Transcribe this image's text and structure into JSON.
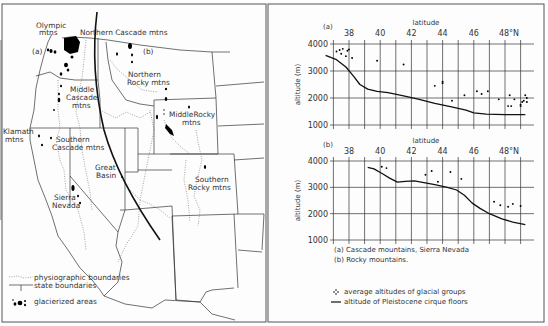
{
  "map": {
    "labels": {
      "olympic": [
        "Olympic",
        "mtns"
      ],
      "northern_cascade": "Northern Cascade mtns",
      "a_marker": "(a)",
      "b_marker": "(b)",
      "northern_rocky": [
        "Northern",
        "Rocky mtns"
      ],
      "middle_cascade": [
        "Middle",
        "Cascade",
        "mtns"
      ],
      "middle_rocky": [
        "MiddleRocky",
        "mtns"
      ],
      "klamath": [
        "Klamath",
        "mtns"
      ],
      "southern_cascade": [
        "Southern",
        "Cascade mtns"
      ],
      "great_basin": [
        "Great",
        "Basin"
      ],
      "sierra_nevada": [
        "Sierra",
        "Nevada"
      ],
      "southern_rocky": [
        "Southern",
        "Rocky mtns"
      ]
    },
    "legend": {
      "physiographic": "physiographic boundaries",
      "state": "state boundaries",
      "glacierized": "glacierized areas"
    }
  },
  "chart_data": [
    {
      "id": "a",
      "type": "scatter+line",
      "panel_label": "(a)",
      "title": "Cascade mountains, Sierra Nevada",
      "xlabel": "latitude",
      "ylabel": "altitude (m)",
      "x_ticks": [
        "38",
        "40",
        "42",
        "44",
        "46",
        "48°N"
      ],
      "x_tick_values": [
        38,
        40,
        42,
        44,
        46,
        48
      ],
      "y_ticks": [
        "4000",
        "3000",
        "2000",
        "1000"
      ],
      "y_tick_values": [
        4000,
        3000,
        2000,
        1000
      ],
      "xlim": [
        37,
        49.5
      ],
      "ylim": [
        1000,
        4000
      ],
      "grid": true,
      "series": [
        {
          "name": "average altitudes of glacial groups",
          "kind": "points",
          "points": [
            [
              37.2,
              3720
            ],
            [
              37.4,
              3780
            ],
            [
              37.6,
              3820
            ],
            [
              37.5,
              3640
            ],
            [
              37.9,
              3750
            ],
            [
              38.0,
              3800
            ],
            [
              37.8,
              3550
            ],
            [
              38.2,
              3480
            ],
            [
              39.8,
              3380
            ],
            [
              41.5,
              3240
            ],
            [
              43.5,
              2450
            ],
            [
              44.0,
              2600
            ],
            [
              44.0,
              2550
            ],
            [
              44.6,
              1900
            ],
            [
              45.4,
              2100
            ],
            [
              46.2,
              2250
            ],
            [
              46.5,
              2150
            ],
            [
              46.9,
              2250
            ],
            [
              47.6,
              1950
            ],
            [
              48.2,
              1700
            ],
            [
              48.3,
              2100
            ],
            [
              48.4,
              1700
            ],
            [
              48.6,
              1950
            ],
            [
              49.0,
              1750
            ],
            [
              49.1,
              1850
            ],
            [
              49.2,
              1900
            ],
            [
              49.3,
              2100
            ],
            [
              49.4,
              2000
            ],
            [
              49.4,
              1850
            ],
            [
              49.0,
              1700
            ]
          ]
        },
        {
          "name": "altitude of Pleistocene cirque floors",
          "kind": "line",
          "points": [
            [
              36.5,
              3580
            ],
            [
              37.2,
              3420
            ],
            [
              37.8,
              3150
            ],
            [
              38.3,
              2800
            ],
            [
              38.7,
              2500
            ],
            [
              39.2,
              2330
            ],
            [
              39.8,
              2250
            ],
            [
              40.5,
              2200
            ],
            [
              41.5,
              2080
            ],
            [
              42.5,
              1950
            ],
            [
              43.5,
              1800
            ],
            [
              44.5,
              1680
            ],
            [
              45.5,
              1550
            ],
            [
              46.0,
              1450
            ],
            [
              46.8,
              1400
            ],
            [
              48.0,
              1380
            ],
            [
              49.3,
              1380
            ]
          ]
        }
      ]
    },
    {
      "id": "b",
      "type": "scatter+line",
      "panel_label": "(b)",
      "title": "Rocky mountains.",
      "xlabel": "latitude",
      "ylabel": "altitude (m)",
      "x_ticks": [
        "38",
        "40",
        "42",
        "44",
        "46",
        "48°N"
      ],
      "x_tick_values": [
        38,
        40,
        42,
        44,
        46,
        48
      ],
      "y_ticks": [
        "4000",
        "3000",
        "2000",
        "1000"
      ],
      "y_tick_values": [
        4000,
        3000,
        2000,
        1000
      ],
      "xlim": [
        37,
        49.5
      ],
      "ylim": [
        1000,
        4000
      ],
      "grid": true,
      "series": [
        {
          "name": "average altitudes of glacial groups",
          "kind": "points",
          "points": [
            [
              40.1,
              3780
            ],
            [
              40.4,
              3730
            ],
            [
              42.9,
              3480
            ],
            [
              43.3,
              3620
            ],
            [
              43.7,
              3210
            ],
            [
              44.5,
              3580
            ],
            [
              45.2,
              3320
            ],
            [
              47.3,
              2450
            ],
            [
              47.7,
              2320
            ],
            [
              48.2,
              2260
            ],
            [
              48.5,
              2370
            ],
            [
              49.0,
              2290
            ]
          ]
        },
        {
          "name": "altitude of Pleistocene cirque floors",
          "kind": "line",
          "points": [
            [
              39.2,
              3760
            ],
            [
              39.6,
              3700
            ],
            [
              40.2,
              3500
            ],
            [
              40.6,
              3350
            ],
            [
              41.1,
              3200
            ],
            [
              41.6,
              3230
            ],
            [
              42.2,
              3250
            ],
            [
              42.8,
              3180
            ],
            [
              43.5,
              3100
            ],
            [
              44.3,
              3000
            ],
            [
              44.9,
              2900
            ],
            [
              45.4,
              2700
            ],
            [
              45.9,
              2400
            ],
            [
              46.4,
              2200
            ],
            [
              47.0,
              2000
            ],
            [
              47.8,
              1800
            ],
            [
              48.5,
              1680
            ],
            [
              49.3,
              1580
            ]
          ]
        }
      ]
    }
  ],
  "captions": {
    "a": "(a)  Cascade mountains, Sierra Nevada",
    "b": "(b)  Rocky mountains."
  },
  "legend": {
    "points": "average altitudes of glacial groups",
    "line": "altitude of Pleistocene cirque floors"
  }
}
